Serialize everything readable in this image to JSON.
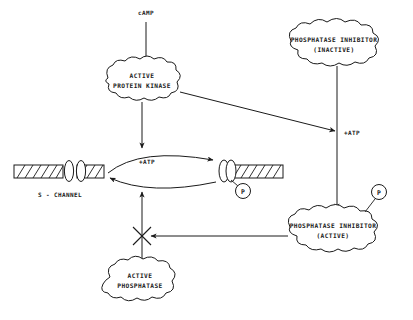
{
  "diagram": {
    "background_color": "#ffffff",
    "ink_color": "#1a1a1a",
    "nodes": {
      "camp": {
        "label": "cAMP"
      },
      "active_protein_kinase": {
        "line1": "ACTIVE",
        "line2": "PROTEIN KINASE"
      },
      "phosphatase_inhibitor_inactive": {
        "line1": "PHOSPHATASE INHIBITOR",
        "line2": "(INACTIVE)"
      },
      "phosphatase_inhibitor_active": {
        "line1": "PHOSPHATASE INHIBITOR",
        "line2": "(ACTIVE)"
      },
      "active_phosphatase": {
        "line1": "ACTIVE",
        "line2": "PHOSPHATASE"
      },
      "s_channel": {
        "label": "S - CHANNEL"
      },
      "atp_center": {
        "label": "+ATP"
      },
      "atp_right": {
        "label": "+ATP"
      },
      "phosphate_channel": {
        "label": "P"
      },
      "phosphate_inhibitor": {
        "label": "P"
      }
    },
    "edges": [
      {
        "name": "camp-to-kinase",
        "from": "cAMP",
        "to": "ACTIVE PROTEIN KINASE",
        "kind": "arrow"
      },
      {
        "name": "kinase-to-channel",
        "from": "ACTIVE PROTEIN KINASE",
        "to": "S-CHANNEL +ATP cycle",
        "kind": "arrow"
      },
      {
        "name": "kinase-to-inhibitor-atp",
        "from": "ACTIVE PROTEIN KINASE",
        "to": "+ATP (inhibitor branch)",
        "kind": "arrow"
      },
      {
        "name": "inactive-inhibitor-to-active-inhibitor",
        "from": "PHOSPHATASE INHIBITOR (INACTIVE)",
        "to": "PHOSPHATASE INHIBITOR (ACTIVE)",
        "kind": "arrow"
      },
      {
        "name": "channel-phosphorylation-cycle",
        "from": "open S-CHANNEL",
        "to": "closed phosphorylated S-CHANNEL",
        "kind": "cycle"
      },
      {
        "name": "phosphatase-to-channel",
        "from": "ACTIVE PHOSPHATASE",
        "to": "S-CHANNEL +ATP cycle",
        "kind": "arrow"
      },
      {
        "name": "active-inhibitor-blocks-phosphatase",
        "from": "PHOSPHATASE INHIBITOR (ACTIVE)",
        "to": "ACTIVE PHOSPHATASE arrow",
        "kind": "inhibition"
      }
    ]
  }
}
